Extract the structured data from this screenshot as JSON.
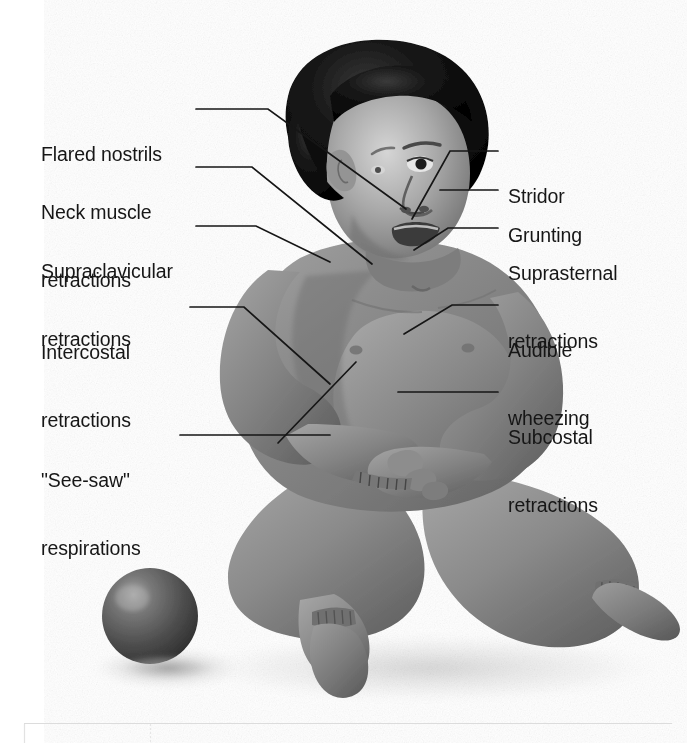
{
  "figure": {
    "background_color": "#ffffff",
    "ink_color": "#161616",
    "skin_tone_mid": "#8a8a8a",
    "skin_tone_light": "#c8c8c8",
    "skin_tone_shadow": "#5a5a5a",
    "hair_color": "#0d0d0d",
    "ball_color": "#4e4e4e",
    "ball_highlight": "#a8a8a8"
  },
  "labels": {
    "left": [
      {
        "id": "flared-nostrils",
        "text": "Flared nostrils",
        "lines": [
          "Flared nostrils"
        ]
      },
      {
        "id": "neck-muscle-retractions",
        "text": "Neck muscle retractions",
        "lines": [
          "Neck muscle",
          "retractions"
        ]
      },
      {
        "id": "supraclavicular-retractions",
        "text": "Supraclavicular retractions",
        "lines": [
          "Supraclavicular",
          "retractions"
        ]
      },
      {
        "id": "intercostal-retractions",
        "text": "Intercostal retractions",
        "lines": [
          "Intercostal",
          "retractions"
        ]
      },
      {
        "id": "see-saw-respirations",
        "text": "\"See-saw\" respirations",
        "lines": [
          "\"See-saw\"",
          "respirations"
        ]
      }
    ],
    "right": [
      {
        "id": "stridor",
        "text": "Stridor",
        "lines": [
          "Stridor"
        ]
      },
      {
        "id": "grunting",
        "text": "Grunting",
        "lines": [
          "Grunting"
        ]
      },
      {
        "id": "suprasternal-retractions",
        "text": "Suprasternal retractions",
        "lines": [
          "Suprasternal",
          "retractions"
        ]
      },
      {
        "id": "audible-wheezing",
        "text": "Audible wheezing",
        "lines": [
          "Audible",
          "wheezing"
        ]
      },
      {
        "id": "subcostal-retractions",
        "text": "Subcostal retractions",
        "lines": [
          "Subcostal",
          "retractions"
        ]
      }
    ]
  },
  "footer": {
    "table_visible": true,
    "table_note": "top edge of a table, no text visible",
    "rule_color": "#d8d8d8"
  }
}
